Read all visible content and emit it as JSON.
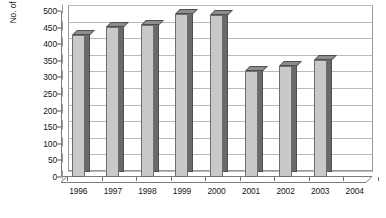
{
  "chart_data": {
    "type": "bar",
    "title": "",
    "subtitle": "",
    "xlabel": "",
    "ylabel": "No. of accounts served per PUB employee",
    "categories": [
      "1996",
      "1997",
      "1998",
      "1999",
      "2000",
      "2001",
      "2002",
      "2003",
      "2004"
    ],
    "values": [
      427,
      452,
      458,
      490,
      488,
      320,
      333,
      353,
      null
    ],
    "series": [
      {
        "name": "No. of accounts served per PUB employee",
        "values": [
          427,
          452,
          458,
          490,
          488,
          320,
          333,
          353,
          null
        ]
      }
    ],
    "ylim": [
      0,
      500
    ],
    "ytick_labels": [
      "500",
      "450",
      "400",
      "350",
      "300",
      "250",
      "200",
      "150",
      "100",
      "50",
      "0"
    ],
    "ytick_values": [
      500,
      450,
      400,
      350,
      300,
      250,
      200,
      150,
      100,
      50,
      0
    ],
    "ytick_step": 50,
    "grid": true,
    "grid_axis": "y",
    "legend": false,
    "legend_position": "none",
    "style": "3d-column"
  },
  "colors": {
    "bar_face": "#c9c9c9",
    "bar_side": "#6a6a6a",
    "bar_top": "#8d8d8d",
    "bar_outline": "#4f4f4f",
    "gridline": "#b9b9b9",
    "axis": "#7b7b7b",
    "text": "#161616",
    "background": "#ffffff"
  }
}
